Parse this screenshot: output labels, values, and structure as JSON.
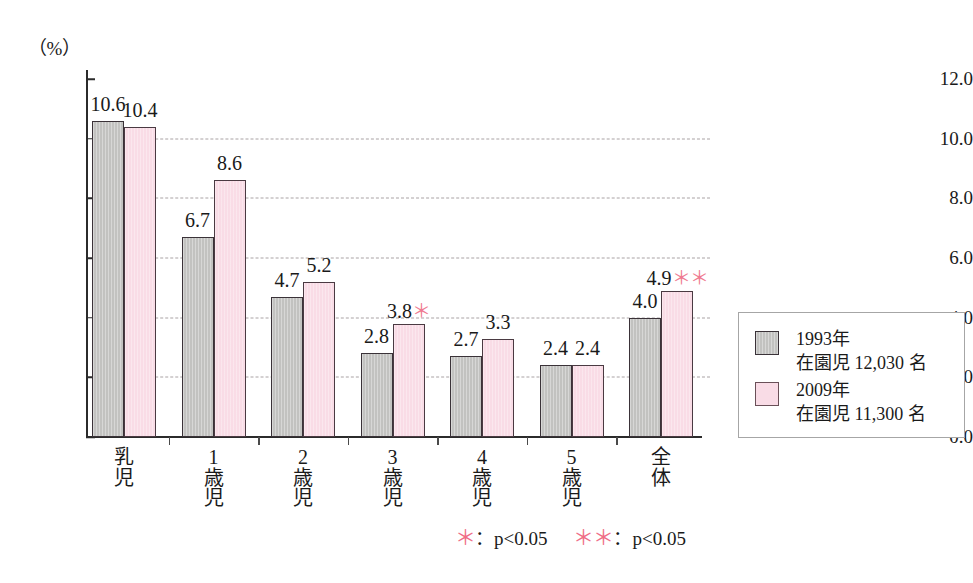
{
  "chart_data": {
    "type": "bar",
    "title": "",
    "subtitle": "",
    "xlabel": "",
    "ylabel": "",
    "unit_label": "（%）",
    "ylim": [
      0.0,
      12.0
    ],
    "ytick_labels": [
      "0.0",
      "2.0",
      "4.0",
      "6.0",
      "8.0",
      "10.0",
      "12.0"
    ],
    "ytick_values": [
      0.0,
      2.0,
      4.0,
      6.0,
      8.0,
      10.0,
      12.0
    ],
    "grid": "horizontal-dashed",
    "legend_position": "right-outside",
    "categories": [
      "乳児",
      "1歳児",
      "2歳児",
      "3歳児",
      "4歳児",
      "5歳児",
      "全体"
    ],
    "category_parts": [
      {
        "num": "",
        "chars": [
          "乳",
          "児"
        ]
      },
      {
        "num": "1",
        "chars": [
          "歳",
          "児"
        ]
      },
      {
        "num": "2",
        "chars": [
          "歳",
          "児"
        ]
      },
      {
        "num": "3",
        "chars": [
          "歳",
          "児"
        ]
      },
      {
        "num": "4",
        "chars": [
          "歳",
          "児"
        ]
      },
      {
        "num": "5",
        "chars": [
          "歳",
          "児"
        ]
      },
      {
        "num": "",
        "chars": [
          "全",
          "体"
        ]
      }
    ],
    "series": [
      {
        "name": "1993年",
        "detail": "在園児 12,030 名",
        "color": "#c2c2c0",
        "values": [
          10.6,
          6.7,
          4.7,
          2.8,
          2.7,
          2.4,
          4.0
        ],
        "labels": [
          "10.6",
          "6.7",
          "4.7",
          "2.8",
          "2.7",
          "2.4",
          "4.0"
        ],
        "significance": [
          "",
          "",
          "",
          "",
          "",
          "",
          ""
        ]
      },
      {
        "name": "2009年",
        "detail": "在園児 11,300 名",
        "color": "#f9dce6",
        "values": [
          10.4,
          8.6,
          5.2,
          3.8,
          3.3,
          2.4,
          4.9
        ],
        "labels": [
          "10.4",
          "8.6",
          "5.2",
          "3.8",
          "3.3",
          "2.4",
          "4.9"
        ],
        "significance": [
          "",
          "",
          "",
          "*",
          "",
          "",
          "**"
        ]
      }
    ],
    "annotations": [
      {
        "symbol": "＊",
        "text": "：p<0.05"
      },
      {
        "symbol": "＊＊",
        "text": "：p<0.05"
      }
    ],
    "accent_color": "#ef6e87",
    "axis_color": "#2b2b2b",
    "grid_color": "#a9a2a4"
  },
  "legend": {
    "entries": [
      {
        "name": "1993年",
        "detail": "在園児 12,030 名"
      },
      {
        "name": "2009年",
        "detail": "在園児 11,300 名"
      }
    ]
  },
  "footnote": {
    "star_1": "＊",
    "text_1": "：p<0.05",
    "star_2": "＊＊",
    "text_2": "：p<0.05"
  }
}
